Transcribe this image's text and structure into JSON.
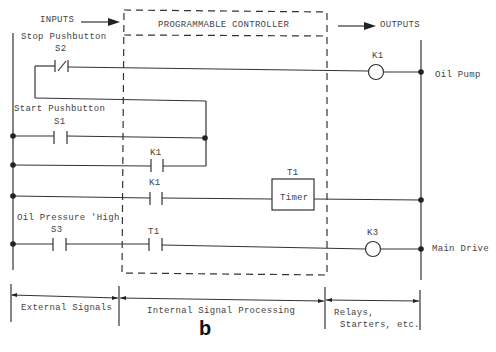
{
  "header": {
    "inputs": "INPUTS",
    "controller": "PROGRAMMABLE CONTROLLER",
    "outputs": "OUTPUTS"
  },
  "rungs": [
    {
      "device_label": "Stop Pushbutton",
      "contact": "S2",
      "contact_type": "normally-closed",
      "output": "K1",
      "output_label": "Oil Pump"
    },
    {
      "device_label": "Start Pushbutton",
      "contact": "S1",
      "contact_type": "normally-open"
    },
    {
      "contact": "K1",
      "contact_type": "normally-open",
      "role": "seal-in"
    },
    {
      "contact": "K1",
      "contact_type": "normally-open",
      "output": "T1",
      "output_box": "Timer"
    },
    {
      "device_label": "Oil Pressure 'High",
      "contact": "S3",
      "contact_type": "normally-open",
      "internal_contact": "T1",
      "output": "K3",
      "output_label": "Main Drive"
    }
  ],
  "sections": {
    "external": "External Signals",
    "internal": "Internal Signal Processing",
    "relays_line1": "Relays,",
    "relays_line2": "Starters, etc."
  },
  "figure_label": "b"
}
